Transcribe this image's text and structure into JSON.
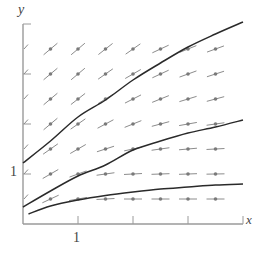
{
  "figure": {
    "type": "slope_field",
    "axes": {
      "x_label": "x",
      "y_label": "y",
      "x_tick_label": "1",
      "y_tick_label": "1",
      "origin_px": [
        23,
        224
      ],
      "x_unit_px": 55,
      "y_unit_px": 50,
      "x_range": [
        0,
        4
      ],
      "y_range": [
        0,
        4
      ],
      "x_ticks": [
        1,
        2,
        3,
        4
      ],
      "y_ticks": [
        1,
        2,
        3,
        4
      ]
    },
    "colors": {
      "axis": "#9a9a9a",
      "segment": "#8c8c8c",
      "dot": "#7a7a7a",
      "curve": "#2a2a2a",
      "label": "#444444"
    },
    "grid": {
      "x_values": [
        0.5,
        1.0,
        1.5,
        2.0,
        2.5,
        3.0,
        3.5
      ],
      "y_values": [
        3.5,
        3.0,
        2.5,
        2.0,
        1.5,
        1.0,
        0.5
      ],
      "slope_angles_deg": [
        [
          40,
          40,
          38,
          35,
          25,
          22,
          20
        ],
        [
          40,
          40,
          35,
          30,
          25,
          20,
          18
        ],
        [
          40,
          38,
          32,
          27,
          22,
          17,
          15
        ],
        [
          40,
          35,
          28,
          22,
          15,
          10,
          8
        ],
        [
          35,
          30,
          18,
          12,
          8,
          5,
          3
        ],
        [
          30,
          20,
          8,
          3,
          2,
          2,
          1
        ],
        [
          25,
          10,
          3,
          0,
          0,
          0,
          0
        ]
      ],
      "edge_marks_y": [
        3.5,
        3.0,
        2.5,
        2.0,
        1.5,
        1.0,
        0.5
      ],
      "edge_mark_angle_deg": 48
    },
    "solution_curves": [
      {
        "name": "upper",
        "points": [
          [
            0,
            1.22
          ],
          [
            0.5,
            1.66
          ],
          [
            1,
            2.14
          ],
          [
            1.5,
            2.48
          ],
          [
            2,
            2.88
          ],
          [
            2.5,
            3.22
          ],
          [
            3,
            3.54
          ],
          [
            3.5,
            3.8
          ],
          [
            4,
            4.04
          ]
        ]
      },
      {
        "name": "middle",
        "points": [
          [
            0,
            0.34
          ],
          [
            0.5,
            0.66
          ],
          [
            1,
            0.96
          ],
          [
            1.5,
            1.18
          ],
          [
            2,
            1.48
          ],
          [
            2.5,
            1.66
          ],
          [
            3,
            1.82
          ],
          [
            3.5,
            1.94
          ],
          [
            4,
            2.08
          ]
        ]
      },
      {
        "name": "lower",
        "points": [
          [
            0.1,
            0.2
          ],
          [
            0.5,
            0.36
          ],
          [
            1,
            0.48
          ],
          [
            1.5,
            0.57
          ],
          [
            2,
            0.64
          ],
          [
            2.5,
            0.7
          ],
          [
            3,
            0.74
          ],
          [
            3.5,
            0.78
          ],
          [
            4,
            0.8
          ]
        ]
      }
    ]
  }
}
